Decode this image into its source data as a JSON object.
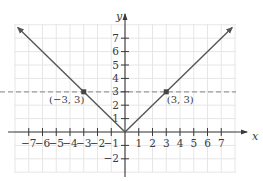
{
  "chart_data": {
    "type": "line",
    "title": "",
    "xlabel": "x",
    "ylabel": "y",
    "xlim": [
      -8,
      8
    ],
    "ylim": [
      -3,
      8
    ],
    "grid": true,
    "x_ticks": [
      -7,
      -6,
      -5,
      -4,
      -3,
      -2,
      -1,
      1,
      2,
      3,
      4,
      5,
      6,
      7
    ],
    "x_tick_labels": [
      "−7",
      "−6",
      "−5",
      "−4",
      "−3",
      "−2",
      "−1",
      "1",
      "2",
      "3",
      "4",
      "5",
      "6",
      "7"
    ],
    "y_ticks": [
      -2,
      -1,
      1,
      2,
      3,
      4,
      5,
      6,
      7
    ],
    "y_tick_labels": [
      "−2",
      "",
      "1",
      "2",
      "3",
      "4",
      "5",
      "6",
      "7"
    ],
    "series": [
      {
        "name": "y = |x|",
        "style": "solid",
        "color": "#555555",
        "x": [
          -7.8,
          -3,
          0,
          3,
          7.8
        ],
        "y": [
          7.8,
          3,
          0,
          3,
          7.8
        ],
        "arrows": "both-ends"
      },
      {
        "name": "y = 3",
        "style": "dashed",
        "color": "#9a9a9a",
        "x": [
          -9,
          8
        ],
        "y": [
          3,
          3
        ]
      }
    ],
    "points": [
      {
        "x": -3,
        "y": 3,
        "label": "(−3, 3)"
      },
      {
        "x": 3,
        "y": 3,
        "label": "(3, 3)"
      }
    ],
    "colors": {
      "curve": "#555555",
      "axes": "#3a3a3a",
      "dashed": "#9a9a9a",
      "grid": "#e6e6e6",
      "point": "#444444"
    }
  }
}
